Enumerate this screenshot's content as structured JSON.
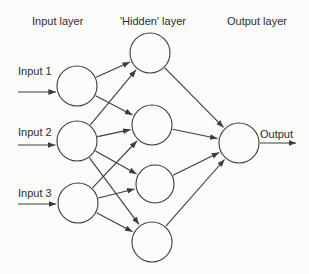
{
  "colors": {
    "background": "#fbfbf9",
    "stroke": "#3c3c3c",
    "node_fill": "#fcfcfb",
    "text": "#2d2d2d"
  },
  "headers": [
    {
      "id": "input-layer",
      "label": "Input layer",
      "x": 32,
      "y": 25
    },
    {
      "id": "hidden-layer",
      "label": "'Hidden' layer",
      "x": 120,
      "y": 25
    },
    {
      "id": "output-layer",
      "label": "Output layer",
      "x": 227,
      "y": 25
    }
  ],
  "nodes": [
    {
      "id": "I1",
      "layer": "input",
      "x": 77,
      "y": 86,
      "r": 20
    },
    {
      "id": "I2",
      "layer": "input",
      "x": 77,
      "y": 141,
      "r": 20
    },
    {
      "id": "I3",
      "layer": "input",
      "x": 78,
      "y": 203,
      "r": 20
    },
    {
      "id": "H1",
      "layer": "hidden",
      "x": 150,
      "y": 53,
      "r": 20
    },
    {
      "id": "H2",
      "layer": "hidden",
      "x": 152,
      "y": 125,
      "r": 20
    },
    {
      "id": "H3",
      "layer": "hidden",
      "x": 155,
      "y": 184,
      "r": 19
    },
    {
      "id": "H4",
      "layer": "hidden",
      "x": 152,
      "y": 242,
      "r": 20
    },
    {
      "id": "O",
      "layer": "output",
      "x": 239,
      "y": 143,
      "r": 20
    }
  ],
  "edges": [
    [
      "I1",
      "H1"
    ],
    [
      "I1",
      "H2"
    ],
    [
      "I2",
      "H1"
    ],
    [
      "I2",
      "H2"
    ],
    [
      "I2",
      "H3"
    ],
    [
      "I2",
      "H4"
    ],
    [
      "I3",
      "H2"
    ],
    [
      "I3",
      "H3"
    ],
    [
      "I3",
      "H4"
    ],
    [
      "H1",
      "O"
    ],
    [
      "H2",
      "O"
    ],
    [
      "H3",
      "O"
    ],
    [
      "H4",
      "O"
    ]
  ],
  "external_inputs": [
    {
      "label": "Input 1",
      "target": "I1",
      "x_start": 18,
      "arrow_y": 92,
      "label_x": 18,
      "label_y": 75
    },
    {
      "label": "Input 2",
      "target": "I2",
      "x_start": 18,
      "arrow_y": 145,
      "label_x": 18,
      "label_y": 136
    },
    {
      "label": "Input 3",
      "target": "I3",
      "x_start": 18,
      "arrow_y": 204,
      "label_x": 18,
      "label_y": 197
    }
  ],
  "external_output": {
    "label": "Output",
    "source": "O",
    "arrow_y": 143,
    "x_end": 296,
    "label_x": 260,
    "label_y": 138
  }
}
